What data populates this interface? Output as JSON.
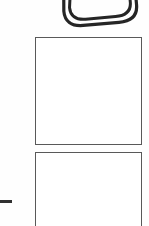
{
  "document": {
    "kind": "scanned-page-fragment",
    "background_color": "#ffffff",
    "ink_color": "#303030",
    "frame_border_color": "#595959",
    "width_px": 149,
    "height_px": 226
  },
  "sketch": {
    "name": "nested-rounded-rectangle-sketch",
    "description": "hand-drawn double-outlined rounded rectangle, rotated, cropped at top edge",
    "stroke_color": "#252525",
    "stroke_width_px": 3,
    "rotation_deg": -5,
    "outline_count": 2,
    "caption": ""
  },
  "frames": [
    {
      "name": "answer-box-1",
      "label": "",
      "content": "",
      "empty": true,
      "x": 35,
      "y": 37,
      "width": 107,
      "height": 108
    },
    {
      "name": "answer-box-2",
      "label": "",
      "content": "",
      "empty": true,
      "cropped_at_bottom": true,
      "x": 35,
      "y": 152,
      "width": 107,
      "height": 82
    }
  ],
  "marks": [
    {
      "name": "left-margin-dash",
      "glyph": "—",
      "text": "",
      "x": 0,
      "y": 200,
      "width": 12,
      "height": 3
    }
  ]
}
